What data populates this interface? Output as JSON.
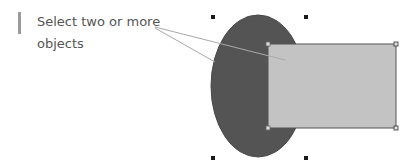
{
  "callout": {
    "text": "Select two or more objects"
  },
  "colors": {
    "ellipse_fill": "#545454",
    "ellipse_stroke": "#4a4a4a",
    "rect_fill": "#c3c3c3",
    "rect_stroke": "#555555",
    "leader_line": "#a8a8a8",
    "handle": "#1a1a1a",
    "callout_bar": "#9a9a9a",
    "text": "#555555"
  },
  "shapes": {
    "ellipse": {
      "cx": 258,
      "cy": 86,
      "rx": 47,
      "ry": 71
    },
    "rectangle": {
      "x": 268,
      "y": 44,
      "width": 128,
      "height": 84
    }
  }
}
